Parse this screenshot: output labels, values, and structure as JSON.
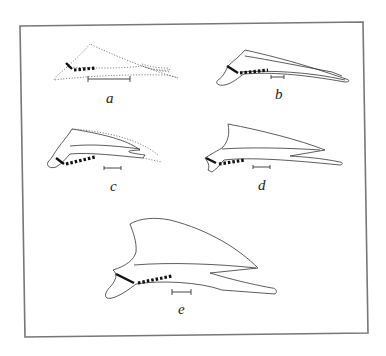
{
  "figure": {
    "panels": [
      {
        "id": "a",
        "label": "a",
        "style": "dotted"
      },
      {
        "id": "b",
        "label": "b",
        "style": "solid"
      },
      {
        "id": "c",
        "label": "c",
        "style": "partially-dotted"
      },
      {
        "id": "d",
        "label": "d",
        "style": "solid"
      },
      {
        "id": "e",
        "label": "e",
        "style": "solid"
      }
    ],
    "colors": {
      "frame": "#777777",
      "line": "#333333",
      "bone": "#111111",
      "background": "#ffffff"
    }
  }
}
